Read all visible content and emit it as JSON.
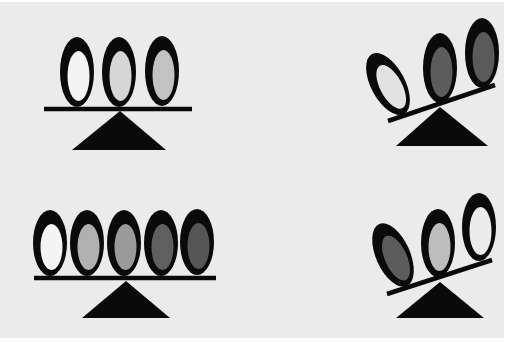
{
  "figure": {
    "background": "#ebebeb",
    "colors": {
      "ring": "#0a0a0a",
      "white": "#f4f4f4",
      "light_gray": "#c8c8c8",
      "medium_gray": "#9a9a9a",
      "dark_gray": "#5c5c5c",
      "darker_gray": "#555555"
    },
    "panels": [
      {
        "name": "top-left",
        "state": "balanced",
        "beam": {
          "x1": 44,
          "y1": 109,
          "x2": 192,
          "y2": 109
        },
        "fulcrum": {
          "apex": [
            120,
            111
          ],
          "base_left": [
            72,
            150
          ],
          "base_right": [
            166,
            150
          ]
        },
        "ovals": [
          {
            "cx": 77,
            "cy": 72,
            "rx": 17,
            "ry": 35,
            "rot": 0,
            "fill": "#f4f4f4"
          },
          {
            "cx": 119,
            "cy": 72,
            "rx": 17,
            "ry": 35,
            "rot": 0,
            "fill": "#d6d6d6"
          },
          {
            "cx": 162,
            "cy": 71,
            "rx": 17,
            "ry": 35,
            "rot": 0,
            "fill": "#c2c2c2"
          }
        ]
      },
      {
        "name": "top-right",
        "state": "tilted-right-heavy",
        "beam": {
          "x1": 388,
          "y1": 121,
          "x2": 495,
          "y2": 85
        },
        "fulcrum": {
          "apex": [
            440,
            107
          ],
          "base_left": [
            396,
            146
          ],
          "base_right": [
            488,
            146
          ]
        },
        "ovals": [
          {
            "cx": 388,
            "cy": 84,
            "rx": 17,
            "ry": 34,
            "rot": -28,
            "fill": "#e2e2e2"
          },
          {
            "cx": 440,
            "cy": 68,
            "rx": 17,
            "ry": 35,
            "rot": 0,
            "fill": "#5c5c5c"
          },
          {
            "cx": 482,
            "cy": 53,
            "rx": 17,
            "ry": 35,
            "rot": 0,
            "fill": "#5a5a5a"
          }
        ]
      },
      {
        "name": "bottom-left",
        "state": "balanced",
        "beam": {
          "x1": 34,
          "y1": 278,
          "x2": 216,
          "y2": 278
        },
        "fulcrum": {
          "apex": [
            126,
            281
          ],
          "base_left": [
            82,
            318
          ],
          "base_right": [
            170,
            318
          ]
        },
        "ovals": [
          {
            "cx": 50,
            "cy": 243,
            "rx": 17,
            "ry": 33,
            "rot": 0,
            "fill": "#f4f4f4"
          },
          {
            "cx": 87,
            "cy": 243,
            "rx": 17,
            "ry": 33,
            "rot": 0,
            "fill": "#b0b0b0"
          },
          {
            "cx": 124,
            "cy": 243,
            "rx": 17,
            "ry": 33,
            "rot": 0,
            "fill": "#9a9a9a"
          },
          {
            "cx": 161,
            "cy": 243,
            "rx": 17,
            "ry": 33,
            "rot": 0,
            "fill": "#5f5f5f"
          },
          {
            "cx": 197,
            "cy": 242,
            "rx": 17,
            "ry": 33,
            "rot": 0,
            "fill": "#555555"
          }
        ]
      },
      {
        "name": "bottom-right",
        "state": "tilted-left-heavy",
        "beam": {
          "x1": 387,
          "y1": 294,
          "x2": 492,
          "y2": 260
        },
        "fulcrum": {
          "apex": [
            440,
            282
          ],
          "base_left": [
            396,
            318
          ],
          "base_right": [
            484,
            318
          ]
        },
        "ovals": [
          {
            "cx": 393,
            "cy": 255,
            "rx": 17,
            "ry": 34,
            "rot": -24,
            "fill": "#5c5c5c"
          },
          {
            "cx": 438,
            "cy": 243,
            "rx": 17,
            "ry": 34,
            "rot": 0,
            "fill": "#bdbdbd"
          },
          {
            "cx": 479,
            "cy": 227,
            "rx": 17,
            "ry": 34,
            "rot": 0,
            "fill": "#ececec"
          }
        ]
      }
    ]
  }
}
